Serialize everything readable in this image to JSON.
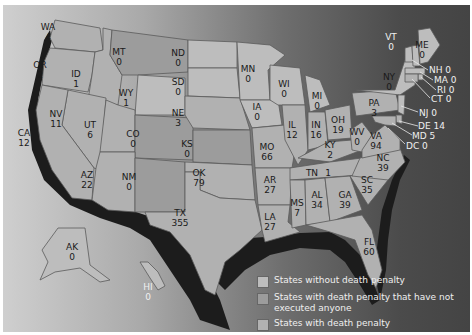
{
  "map": {
    "subject": "Executions by state",
    "states": [
      {
        "abbr": "WA",
        "value": "4",
        "x": 48,
        "y": 30
      },
      {
        "abbr": "OR",
        "value": "2",
        "x": 40,
        "y": 68
      },
      {
        "abbr": "ID",
        "value": "1",
        "x": 76,
        "y": 77
      },
      {
        "abbr": "MT",
        "value": "0",
        "x": 119,
        "y": 55
      },
      {
        "abbr": "ND",
        "value": "0",
        "x": 178,
        "y": 56
      },
      {
        "abbr": "SD",
        "value": "0",
        "x": 178,
        "y": 85
      },
      {
        "abbr": "WY",
        "value": "1",
        "x": 126,
        "y": 96
      },
      {
        "abbr": "NE",
        "value": "3",
        "x": 178,
        "y": 116
      },
      {
        "abbr": "NV",
        "value": "11",
        "x": 56,
        "y": 117
      },
      {
        "abbr": "UT",
        "value": "6",
        "x": 90,
        "y": 128
      },
      {
        "abbr": "CO",
        "value": "0",
        "x": 133,
        "y": 137
      },
      {
        "abbr": "KS",
        "value": "0",
        "x": 187,
        "y": 147
      },
      {
        "abbr": "CA",
        "value": "12",
        "x": 18,
        "y": 136
      },
      {
        "abbr": "AZ",
        "value": "22",
        "x": 87,
        "y": 178
      },
      {
        "abbr": "NM",
        "value": "0",
        "x": 129,
        "y": 180
      },
      {
        "abbr": "OK",
        "value": "79",
        "x": 199,
        "y": 176
      },
      {
        "abbr": "TX",
        "value": "355",
        "x": 180,
        "y": 216
      },
      {
        "abbr": "MN",
        "value": "0",
        "x": 248,
        "y": 72
      },
      {
        "abbr": "IA",
        "value": "0",
        "x": 257,
        "y": 110
      },
      {
        "abbr": "MO",
        "value": "66",
        "x": 267,
        "y": 150
      },
      {
        "abbr": "AR",
        "value": "27",
        "x": 270,
        "y": 183
      },
      {
        "abbr": "LA",
        "value": "27",
        "x": 270,
        "y": 220
      },
      {
        "abbr": "WI",
        "value": "0",
        "x": 284,
        "y": 87
      },
      {
        "abbr": "IL",
        "value": "12",
        "x": 290,
        "y": 128
      },
      {
        "abbr": "MI",
        "value": "0",
        "x": 317,
        "y": 99
      },
      {
        "abbr": "IN",
        "value": "16",
        "x": 316,
        "y": 128
      },
      {
        "abbr": "OH",
        "value": "19",
        "x": 336,
        "y": 123
      },
      {
        "abbr": "KY",
        "value": "2",
        "x": 328,
        "y": 148
      },
      {
        "abbr": "WV",
        "value": "0",
        "x": 356,
        "y": 133
      },
      {
        "abbr": "VA",
        "value": "94",
        "x": 376,
        "y": 136
      },
      {
        "abbr": "TN",
        "value": "1",
        "x": 309,
        "y": 173
      },
      {
        "abbr": "MS",
        "value": "7",
        "x": 294,
        "y": 206
      },
      {
        "abbr": "AL",
        "value": "34",
        "x": 317,
        "y": 198
      },
      {
        "abbr": "GA",
        "value": "39",
        "x": 345,
        "y": 198
      },
      {
        "abbr": "SC",
        "value": "35",
        "x": 366,
        "y": 183
      },
      {
        "abbr": "NC",
        "value": "39",
        "x": 383,
        "y": 161
      },
      {
        "abbr": "FL",
        "value": "60",
        "x": 369,
        "y": 242
      },
      {
        "abbr": "PA",
        "value": "3",
        "x": 374,
        "y": 104
      },
      {
        "abbr": "NY",
        "value": "0",
        "x": 389,
        "y": 78
      },
      {
        "abbr": "VT",
        "value": "0",
        "x": 391,
        "y": 36
      },
      {
        "abbr": "ME",
        "value": "0",
        "x": 420,
        "y": 45
      },
      {
        "abbr": "AK",
        "value": "0",
        "x": 72,
        "y": 247
      },
      {
        "abbr": "HI",
        "value": "0",
        "x": 148,
        "y": 286
      }
    ],
    "callouts": [
      {
        "abbr": "NH",
        "value": "0",
        "text": "NH 0"
      },
      {
        "abbr": "MA",
        "value": "0",
        "text": "MA 0"
      },
      {
        "abbr": "RI",
        "value": "0",
        "text": "RI 0"
      },
      {
        "abbr": "CT",
        "value": "0",
        "text": "CT 0"
      },
      {
        "abbr": "NJ",
        "value": "0",
        "text": "NJ 0"
      },
      {
        "abbr": "DE",
        "value": "14",
        "text": "DE 14"
      },
      {
        "abbr": "MD",
        "value": "5",
        "text": "MD 5"
      },
      {
        "abbr": "DC",
        "value": "0",
        "text": "DC 0"
      }
    ]
  },
  "legend": {
    "items": [
      {
        "label": "States without death penalty",
        "color": "#bdbdbd"
      },
      {
        "label": "States with death penalty that have not executed anyone",
        "color": "#9c9c9c"
      },
      {
        "label": "States with death penalty",
        "color": "#b1b1b1"
      }
    ]
  },
  "colors": {
    "background_left": "#cfcfcf",
    "background_right": "#444444",
    "coast_shadow": "#1c1c1c",
    "label_text": "#1a1a1a",
    "callout_text": "#f0f0f0"
  }
}
